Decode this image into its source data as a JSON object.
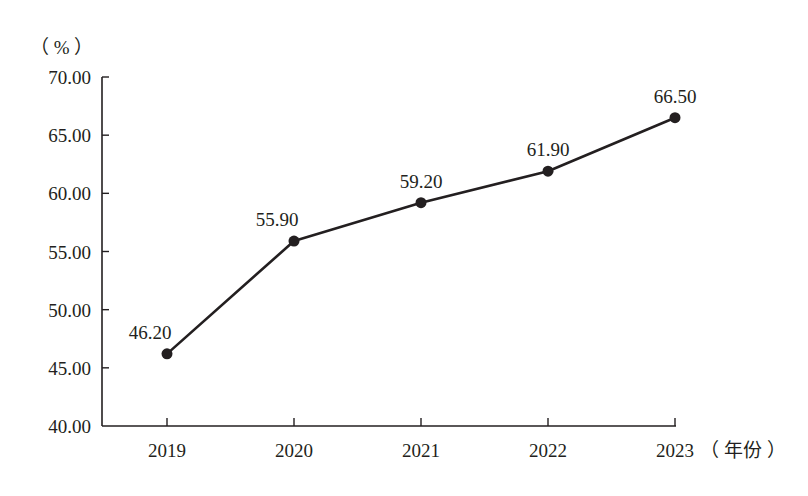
{
  "chart_data": {
    "type": "line",
    "title": "",
    "xlabel": "（年份）",
    "ylabel": "（%）",
    "categories": [
      "2019",
      "2020",
      "2021",
      "2022",
      "2023"
    ],
    "series": [
      {
        "name": "",
        "values": [
          46.2,
          55.9,
          59.2,
          61.9,
          66.5
        ],
        "labels": [
          "46.20",
          "55.90",
          "59.20",
          "61.90",
          "66.50"
        ]
      }
    ],
    "ylim": [
      40,
      70
    ],
    "yticks": [
      "40.00",
      "45.00",
      "50.00",
      "55.00",
      "60.00",
      "65.00",
      "70.00"
    ],
    "grid": false,
    "legend": "none",
    "markers": "filled-circle"
  },
  "axis": {
    "y_unit": "（ % ）",
    "x_unit": "（ 年份 ）"
  },
  "colors": {
    "line": "#231f20",
    "axis": "#231f20",
    "text": "#231f20"
  }
}
